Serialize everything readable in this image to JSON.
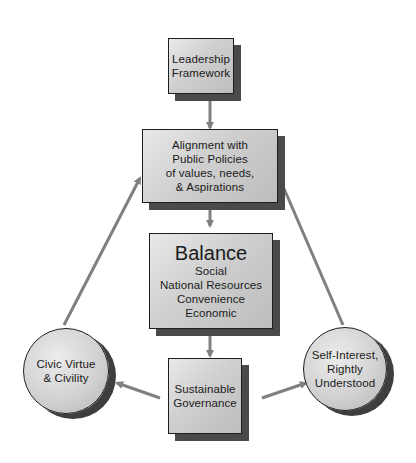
{
  "diagram": {
    "leadership": {
      "lines": [
        "Leadership",
        "Framework"
      ]
    },
    "alignment": {
      "lines": [
        "Alignment with",
        "Public Policies",
        "of values, needs,",
        "& Aspirations"
      ]
    },
    "balance": {
      "title": "Balance",
      "lines": [
        "Social",
        "National Resources",
        "Convenience",
        "Economic"
      ]
    },
    "sustainable": {
      "lines": [
        "Sustainable",
        "Governance"
      ]
    },
    "civic": {
      "lines": [
        "Civic Virtue",
        "& Civility"
      ]
    },
    "self_interest": {
      "lines": [
        "Self-Interest,",
        "Rightly",
        "Understood"
      ]
    },
    "colors": {
      "arrow": "#808080",
      "border": "#1e1e1e",
      "shadow": "#4a4a4a",
      "fill": "#d0d0d0"
    },
    "edges": [
      {
        "from": "Leadership Framework",
        "to": "Alignment with Public Policies"
      },
      {
        "from": "Alignment with Public Policies",
        "to": "Balance"
      },
      {
        "from": "Balance",
        "to": "Sustainable Governance"
      },
      {
        "from": "Sustainable Governance",
        "to": "Civic Virtue & Civility"
      },
      {
        "from": "Sustainable Governance",
        "to": "Self-Interest, Rightly Understood"
      },
      {
        "from": "Civic Virtue & Civility",
        "to": "Alignment with Public Policies"
      },
      {
        "from": "Self-Interest, Rightly Understood",
        "to": "Alignment with Public Policies"
      }
    ]
  }
}
